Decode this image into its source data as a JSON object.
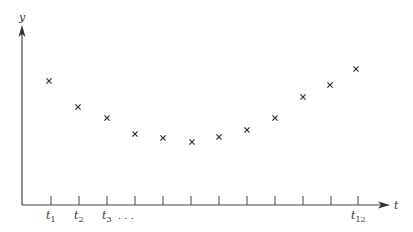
{
  "chart_data": {
    "type": "scatter",
    "title": "",
    "xlabel": "t",
    "ylabel": "y",
    "x": [
      1,
      2,
      3,
      4,
      5,
      6,
      7,
      8,
      9,
      10,
      11,
      12
    ],
    "tick_labels": [
      "t1",
      "t2",
      "t3",
      "",
      "",
      "",
      "",
      "",
      "",
      "",
      "",
      "t12"
    ],
    "ellipsis_after_t3": "...",
    "values": [
      0.75,
      0.59,
      0.52,
      0.43,
      0.4,
      0.38,
      0.41,
      0.46,
      0.53,
      0.66,
      0.73,
      0.83
    ],
    "marker": "x",
    "grid": false,
    "legend": null,
    "pixel_points": [
      [
        49,
        81
      ],
      [
        78,
        107
      ],
      [
        107,
        118
      ],
      [
        135,
        134
      ],
      [
        163,
        138
      ],
      [
        192,
        142
      ],
      [
        219,
        137
      ],
      [
        247,
        130
      ],
      [
        275,
        118
      ],
      [
        303,
        97
      ],
      [
        330,
        85
      ],
      [
        356,
        69
      ]
    ]
  },
  "axes": {
    "y_label": "y",
    "x_label": "t",
    "tick_labels": {
      "t1": {
        "base": "t",
        "sub": "1"
      },
      "t2": {
        "base": "t",
        "sub": "2"
      },
      "t3": {
        "base": "t",
        "sub": "3"
      },
      "t12": {
        "base": "t",
        "sub": "12"
      }
    },
    "ellipsis": ". . ."
  }
}
